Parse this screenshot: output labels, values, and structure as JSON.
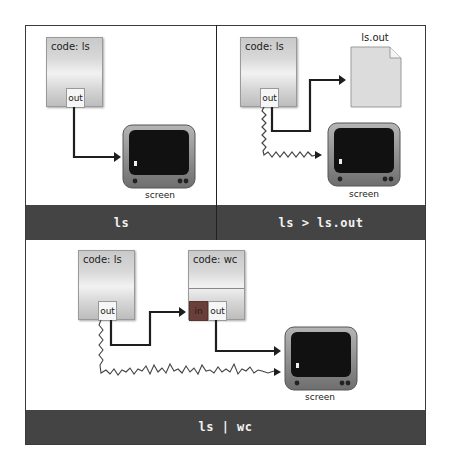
{
  "panels": [
    {
      "id": "ls",
      "command": "ls",
      "processes": [
        {
          "title": "code: ls",
          "ports": [
            "out"
          ]
        }
      ],
      "outputs": [
        {
          "label": "screen",
          "type": "monitor"
        }
      ]
    },
    {
      "id": "redirect",
      "command": "ls > ls.out",
      "processes": [
        {
          "title": "code: ls",
          "ports": [
            "out"
          ]
        }
      ],
      "outputs": [
        {
          "label": "ls.out",
          "type": "file"
        },
        {
          "label": "screen",
          "type": "monitor"
        }
      ]
    },
    {
      "id": "pipe",
      "command": "ls | wc",
      "processes": [
        {
          "title": "code: ls",
          "ports": [
            "out"
          ]
        },
        {
          "title": "code: wc",
          "ports": [
            "in",
            "out"
          ]
        }
      ],
      "outputs": [
        {
          "label": "screen",
          "type": "monitor"
        }
      ]
    }
  ],
  "colors": {
    "command_bar": "#444444",
    "command_text": "#f2f2f2",
    "in_port": "#6a3e3a",
    "arrow": "#1e1e1e",
    "monitor_screen": "#111111",
    "monitor_body": "#8a8a8a"
  },
  "icons": {
    "monitor": "monitor-icon",
    "file": "document-icon",
    "arrow": "arrow-right-icon"
  }
}
